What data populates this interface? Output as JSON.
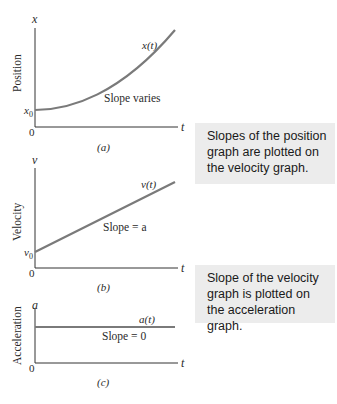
{
  "graphs": {
    "a": {
      "caption": "(a)",
      "ylabel": "Position",
      "yaxis_symbol": "x",
      "xaxis_symbol": "t",
      "origin": "0",
      "intercept": "x",
      "intercept_sub": "0",
      "curve_label": "x(t)",
      "note": "Slope varies"
    },
    "b": {
      "caption": "(b)",
      "ylabel": "Velocity",
      "yaxis_symbol": "v",
      "xaxis_symbol": "t",
      "origin": "0",
      "intercept": "v",
      "intercept_sub": "0",
      "curve_label": "v(t)",
      "note": "Slope = a"
    },
    "c": {
      "caption": "(c)",
      "ylabel": "Acceleration",
      "yaxis_symbol": "a",
      "xaxis_symbol": "t",
      "origin": "0",
      "curve_label": "a(t)",
      "note": "Slope = 0"
    }
  },
  "callouts": [
    {
      "text": "Slopes of the position graph are plotted on the velocity graph."
    },
    {
      "text": "Slope of the velocity graph is plotted on the acceleration graph."
    }
  ],
  "colors": {
    "curve": "#7a7a7a",
    "axis": "#333333",
    "callout_bg": "#ececec"
  }
}
